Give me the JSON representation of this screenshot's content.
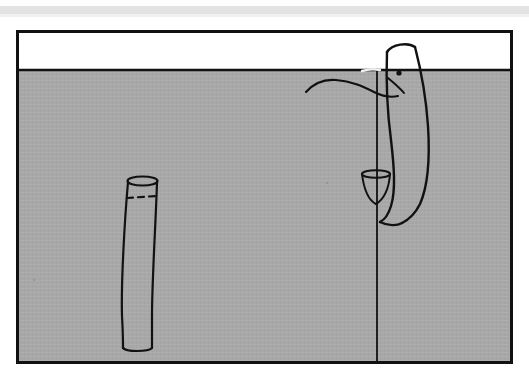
{
  "page": {
    "width": 529,
    "height": 376,
    "background_color": "#ffffff",
    "kind": "scanned-line-drawing-figure"
  },
  "scan_artifact": {
    "name": "top-scan-band",
    "color": "#e3e3e3",
    "secondary_color": "#f1f1f1",
    "top": 6,
    "height": 8
  },
  "figure": {
    "title": "",
    "caption": "",
    "frame": {
      "left": 16,
      "top": 30,
      "width": 497,
      "height": 334,
      "border_color": "#111111",
      "border_width": 3
    },
    "background": {
      "sky_color": "#ffffff",
      "ground_color": "#a8a8a8",
      "horizon_y": 40,
      "horizon_line_color": "#111111"
    },
    "stroke_color": "#111111",
    "elements": [
      {
        "name": "left-cylinder",
        "label": "",
        "description": "upright slightly curved cylindrical log with elliptical open top and dashed band",
        "has_dashed_band": true
      },
      {
        "name": "vertical-post",
        "label": "",
        "description": "thin vertical line running from horizon down to the bottom frame edge"
      },
      {
        "name": "right-bent-strip",
        "label": "",
        "description": "long curved strip rising above the horizon and bending down to the ground"
      },
      {
        "name": "hanging-cup",
        "label": "",
        "description": "small tapered cup or pot hanging on the post"
      },
      {
        "name": "wavy-branch",
        "label": "",
        "description": "wavy line approaching from the left and meeting the bent strip"
      },
      {
        "name": "knot-dot",
        "label": "",
        "description": "small filled dot marking on the bent strip"
      },
      {
        "name": "knot-stroke",
        "label": "",
        "description": "short diagonal stroke beside the dot"
      }
    ]
  }
}
